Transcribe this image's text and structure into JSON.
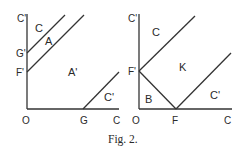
{
  "caption": "Fig. 2.",
  "panels": [
    {
      "id": "left",
      "axis_labels": {
        "y_top": "C'",
        "origin": "O",
        "x_end": "C"
      },
      "tick_labels": {
        "G_prime": "G'",
        "F_prime": "F'",
        "G": "G"
      },
      "regions": {
        "C": "C",
        "A": "A",
        "A_prime": "A'",
        "C_prime": "C'"
      }
    },
    {
      "id": "right",
      "axis_labels": {
        "y_top": "C'",
        "origin": "O",
        "x_end": "C"
      },
      "tick_labels": {
        "F_prime": "F'",
        "F": "F"
      },
      "regions": {
        "C": "C",
        "K": "K",
        "B": "B",
        "C_prime": "C'"
      }
    }
  ],
  "colors": {
    "stroke": "#333333",
    "text": "#2a2a2a",
    "background": "#ffffff"
  }
}
